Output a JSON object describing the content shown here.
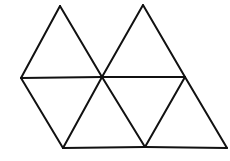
{
  "figure": {
    "stroke_color": "#111111",
    "background_color": "#ffffff",
    "vertices": {
      "A": [
        60,
        6
      ],
      "B": [
        143,
        5
      ],
      "C": [
        21,
        78
      ],
      "D": [
        102,
        77
      ],
      "E": [
        185,
        77
      ],
      "F": [
        63,
        148
      ],
      "G": [
        145,
        147
      ],
      "H": [
        227,
        148
      ]
    },
    "segments": [
      [
        "C",
        "A"
      ],
      [
        "A",
        "D"
      ],
      [
        "D",
        "B"
      ],
      [
        "B",
        "E"
      ],
      [
        "C",
        "D"
      ],
      [
        "D",
        "E"
      ],
      [
        "C",
        "F"
      ],
      [
        "F",
        "D"
      ],
      [
        "D",
        "G"
      ],
      [
        "G",
        "E"
      ],
      [
        "E",
        "H"
      ],
      [
        "F",
        "G"
      ],
      [
        "G",
        "H"
      ]
    ],
    "triangle_count": 6
  }
}
